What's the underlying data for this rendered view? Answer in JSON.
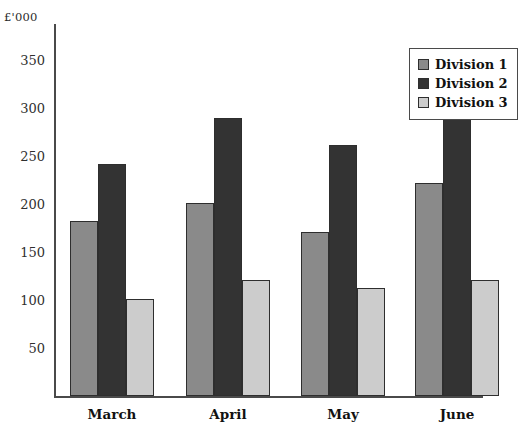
{
  "chart_data": {
    "type": "bar",
    "title": "",
    "subtitle": "",
    "xlabel": "",
    "ylabel": "£'000",
    "categories": [
      "March",
      "April",
      "May",
      "June"
    ],
    "series": [
      {
        "name": "Division 1",
        "color": "#8a8a8a",
        "values": [
          182,
          201,
          171,
          222
        ]
      },
      {
        "name": "Division 2",
        "color": "#333333",
        "values": [
          242,
          290,
          261,
          302
        ]
      },
      {
        "name": "Division 3",
        "color": "#cccccc",
        "values": [
          101,
          121,
          112,
          121
        ]
      }
    ],
    "yticks": [
      50,
      100,
      150,
      200,
      250,
      300,
      350
    ],
    "ytick_labels": [
      "50",
      "100",
      "150",
      "200",
      "250",
      "300",
      "350"
    ],
    "ylim": [
      0,
      387
    ],
    "grid": false,
    "legend_position": "top-right",
    "legend_entries": [
      "Division 1",
      "Division 2",
      "Division 3"
    ]
  },
  "axis": {
    "unit_caption": "£'000"
  }
}
